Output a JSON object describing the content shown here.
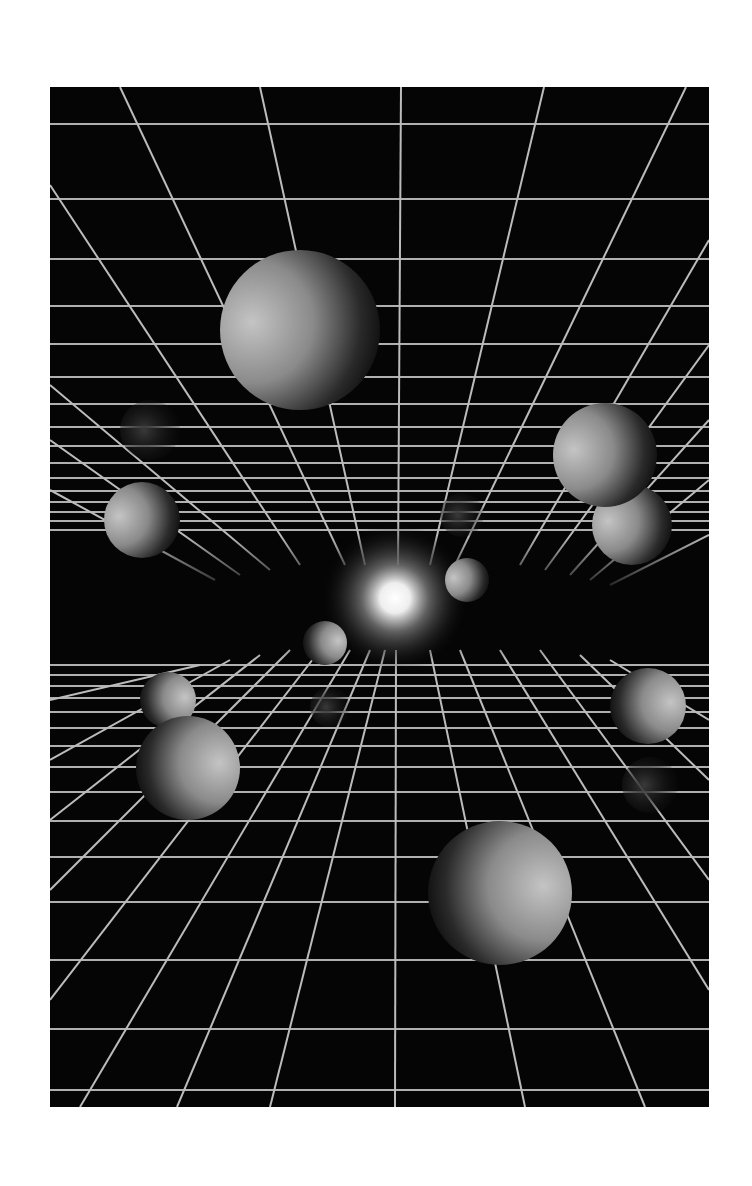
{
  "artwork": {
    "description": "Monochrome 3D rendering of spheres floating inside a perspective grid tunnel with a bright glowing light at the vanishing point",
    "colors": {
      "background_page": "#ffffff",
      "background_scene": "#050505",
      "grid_line": "#b8b8b8",
      "sphere_light": "#bdbdbd",
      "sphere_dark": "#0a0a0a",
      "glow": "#ffffff"
    },
    "frame": {
      "x": 50,
      "y": 87,
      "width": 659,
      "height": 1020
    },
    "vanishing_point": {
      "x": 395,
      "y": 598
    },
    "spheres": [
      {
        "id": "top-large",
        "cx": 300,
        "cy": 330,
        "r": 80,
        "light": "left"
      },
      {
        "id": "right-upper",
        "cx": 605,
        "cy": 455,
        "r": 52,
        "light": "left"
      },
      {
        "id": "right-upper-lower",
        "cx": 632,
        "cy": 525,
        "r": 40,
        "light": "left"
      },
      {
        "id": "left-mid",
        "cx": 142,
        "cy": 520,
        "r": 38,
        "light": "left"
      },
      {
        "id": "center-right-small",
        "cx": 467,
        "cy": 580,
        "r": 22,
        "light": "left"
      },
      {
        "id": "center-left-small",
        "cx": 325,
        "cy": 643,
        "r": 22,
        "light": "right"
      },
      {
        "id": "left-lower-small",
        "cx": 168,
        "cy": 700,
        "r": 28,
        "light": "right"
      },
      {
        "id": "left-lower-large",
        "cx": 188,
        "cy": 768,
        "r": 52,
        "light": "right"
      },
      {
        "id": "right-mid",
        "cx": 648,
        "cy": 706,
        "r": 38,
        "light": "right"
      },
      {
        "id": "bottom-large",
        "cx": 500,
        "cy": 893,
        "r": 72,
        "light": "right"
      }
    ],
    "ghost_spheres": [
      {
        "id": "ghost-left",
        "cx": 150,
        "cy": 430,
        "r": 30
      },
      {
        "id": "ghost-center",
        "cx": 462,
        "cy": 515,
        "r": 22
      },
      {
        "id": "ghost-center-low",
        "cx": 330,
        "cy": 707,
        "r": 20
      },
      {
        "id": "ghost-right",
        "cx": 650,
        "cy": 785,
        "r": 28
      }
    ]
  }
}
